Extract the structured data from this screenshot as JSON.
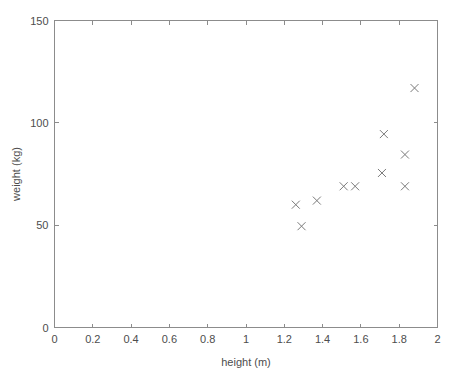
{
  "chart_data": {
    "type": "scatter",
    "title": "",
    "xlabel": "height (m)",
    "ylabel": "weight (kg)",
    "xlim": [
      0,
      2
    ],
    "ylim": [
      0,
      150
    ],
    "xticks": [
      0,
      0.2,
      0.4,
      0.6,
      0.8,
      1,
      1.2,
      1.4,
      1.6,
      1.8,
      2
    ],
    "xticklabels": [
      "0",
      "0.2",
      "0.4",
      "0.6",
      "0.8",
      "1",
      "1.2",
      "1.4",
      "1.6",
      "1.8",
      "2"
    ],
    "yticks": [
      0,
      50,
      100,
      150
    ],
    "yticklabels": [
      "0",
      "50",
      "100",
      "150"
    ],
    "grid": false,
    "legend": null,
    "marker": "x",
    "marker_color": "#7a7a7a",
    "box": true,
    "series": [
      {
        "name": "",
        "points": [
          {
            "x": 1.26,
            "y": 60.0
          },
          {
            "x": 1.29,
            "y": 49.5
          },
          {
            "x": 1.37,
            "y": 62.0
          },
          {
            "x": 1.51,
            "y": 69.0
          },
          {
            "x": 1.57,
            "y": 69.0
          },
          {
            "x": 1.71,
            "y": 75.5
          },
          {
            "x": 1.72,
            "y": 94.5
          },
          {
            "x": 1.83,
            "y": 84.5
          },
          {
            "x": 1.83,
            "y": 69.0
          },
          {
            "x": 1.88,
            "y": 117.0
          }
        ]
      }
    ]
  },
  "figure": {
    "background_color": "#ffffff",
    "axis_color": "#8c8c8c",
    "text_color": "#4d4d4d"
  }
}
